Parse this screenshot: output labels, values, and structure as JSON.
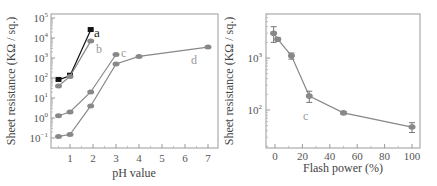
{
  "chart_data": [
    {
      "type": "line",
      "title": "",
      "xlabel": "pH value",
      "ylabel": "Sheet resistance (KΩ / sq.)",
      "yscale": "log",
      "ylim": [
        0.1,
        100000
      ],
      "xlim": [
        0.3,
        7.2
      ],
      "x_ticks": [
        1,
        2,
        3,
        4,
        5,
        6,
        7
      ],
      "y_ticks": [
        "10^-1",
        "10^0",
        "10^1",
        "10^2",
        "10^3",
        "10^4",
        "10^5"
      ],
      "grid": false,
      "series": [
        {
          "name": "a",
          "marker": "square",
          "color": "#111111",
          "x": [
            0.5,
            1.0,
            1.9
          ],
          "y": [
            80,
            130,
            25000
          ]
        },
        {
          "name": "b",
          "marker": "circle",
          "color": "#888888",
          "x": [
            0.5,
            1.0,
            1.9
          ],
          "y": [
            40,
            120,
            7000
          ]
        },
        {
          "name": "c",
          "marker": "circle",
          "color": "#888888",
          "x": [
            0.5,
            1.0,
            1.9,
            3.0
          ],
          "y": [
            1.3,
            2,
            20,
            1500
          ]
        },
        {
          "name": "d",
          "marker": "circle",
          "color": "#888888",
          "x": [
            0.5,
            1.0,
            1.9,
            3.0,
            4.0,
            7.0
          ],
          "y": [
            0.12,
            0.15,
            4,
            500,
            1200,
            3500
          ]
        }
      ]
    },
    {
      "type": "line",
      "title": "",
      "xlabel": "Flash power (%)",
      "ylabel": "Sheet resistance (KΩ / sq.)",
      "yscale": "log",
      "ylim": [
        20,
        8000
      ],
      "xlim": [
        -5,
        105
      ],
      "x_ticks": [
        0,
        20,
        40,
        60,
        80,
        100
      ],
      "y_ticks": [
        "10^2",
        "10^3"
      ],
      "grid": false,
      "annotation": "c",
      "series": [
        {
          "name": "c",
          "marker": "circle",
          "color": "#888888",
          "error_bars": true,
          "x": [
            -1,
            2,
            12,
            25,
            50,
            100
          ],
          "y": [
            3000,
            2300,
            1100,
            185,
            88,
            47
          ],
          "err_low": [
            1000,
            150,
            150,
            45,
            5,
            10
          ],
          "err_high": [
            1000,
            150,
            150,
            45,
            5,
            10
          ]
        }
      ]
    }
  ],
  "labels": {
    "left_ylabel": "Sheet resistance (KΩ / sq.)",
    "left_xlabel": "pH value",
    "right_ylabel": "Sheet resistance (KΩ / sq.)",
    "right_xlabel": "Flash power (%)",
    "series_a": "a",
    "series_b": "b",
    "series_c": "c",
    "series_d": "d",
    "right_annotation": "c"
  }
}
